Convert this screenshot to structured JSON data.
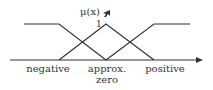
{
  "diagram": {
    "y_axis_label": "μ(x)",
    "peak_value_label": "1",
    "cursor_glyph": "pointer-arrow",
    "line_color": "#333333",
    "labels": {
      "negative": "negative",
      "zero_line1": "approx.",
      "zero_line2": "zero",
      "positive": "positive"
    },
    "sets": [
      {
        "name": "negative",
        "shape": "Z (left shoulder)",
        "points": [
          [
            24,
            24
          ],
          [
            59,
            24
          ],
          [
            106,
            60
          ]
        ]
      },
      {
        "name": "approx. zero",
        "shape": "triangle",
        "points": [
          [
            59,
            60
          ],
          [
            106,
            24
          ],
          [
            154,
            60
          ]
        ]
      },
      {
        "name": "positive",
        "shape": "S (right shoulder)",
        "points": [
          [
            106,
            60
          ],
          [
            154,
            24
          ],
          [
            190,
            24
          ]
        ]
      }
    ]
  }
}
